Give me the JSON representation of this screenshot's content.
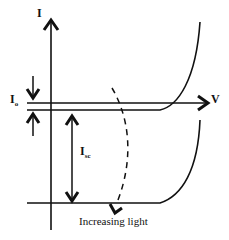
{
  "diagram": {
    "title": "",
    "labels": {
      "current_axis": "I",
      "voltage_axis": "V",
      "dark_current_main": "I",
      "dark_current_sub": "o",
      "short_circuit_main": "I",
      "short_circuit_sub": "sc",
      "light_direction": "Increasing light"
    },
    "colors": {
      "line": "#111111",
      "background": "#ffffff"
    },
    "elements": [
      {
        "name": "current-axis",
        "type": "arrow",
        "direction": "up"
      },
      {
        "name": "voltage-axis",
        "type": "arrow",
        "direction": "right"
      },
      {
        "name": "dark-iv-curve",
        "type": "curve",
        "description": "I-V curve in dark, slightly below V axis"
      },
      {
        "name": "illuminated-iv-curve",
        "type": "curve",
        "description": "I-V curve under illumination, shifted down by Isc"
      },
      {
        "name": "io-arrows",
        "type": "double-arrow",
        "description": "inward arrows marking Io gap"
      },
      {
        "name": "isc-arrow",
        "type": "double-arrow",
        "description": "vertical arrow marking Isc"
      },
      {
        "name": "increasing-light-arrow",
        "type": "dashed-arrow"
      }
    ]
  }
}
